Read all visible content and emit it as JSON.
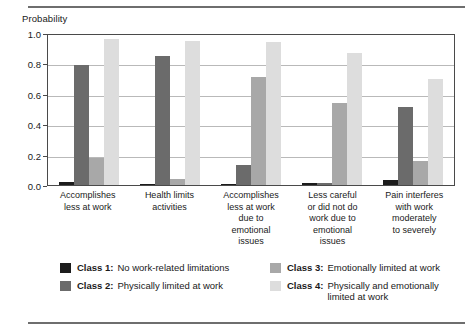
{
  "figure": {
    "y_axis_title": "Probability"
  },
  "chart_data": {
    "type": "bar",
    "title": "",
    "xlabel": "",
    "ylabel": "Probability",
    "ylim": [
      0.0,
      1.0
    ],
    "yticks": [
      "0.0",
      "0.2",
      "0.4",
      "0.6",
      "0.8",
      "1.0"
    ],
    "ytick_values": [
      0.0,
      0.2,
      0.4,
      0.6,
      0.8,
      1.0
    ],
    "grid": true,
    "legend_position": "bottom",
    "categories": [
      "Accomplishes less at work",
      "Health limits activities",
      "Accomplishes less at work due to emotional issues",
      "Less careful or did not do work due to emotional issues",
      "Pain interferes with work moderately to severely"
    ],
    "category_lines": [
      [
        "Accomplishes",
        "less at work"
      ],
      [
        "Health limits",
        "activities"
      ],
      [
        "Accomplishes",
        "less at work",
        "due to",
        "emotional",
        "issues"
      ],
      [
        "Less careful",
        "or did not do",
        "work due to",
        "emotional",
        "issues"
      ],
      [
        "Pain interferes",
        "with work",
        "moderately",
        "to severely"
      ]
    ],
    "series": [
      {
        "name": "Class 1",
        "label": "Class 1:",
        "description": "No work-related limitations",
        "color": "#1c1c1c",
        "values": [
          0.02,
          0.005,
          0.005,
          0.01,
          0.03
        ]
      },
      {
        "name": "Class 2",
        "label": "Class 2:",
        "description": "Physically limited at work",
        "color": "#6b6b6b",
        "values": [
          0.79,
          0.85,
          0.13,
          0.01,
          0.51
        ]
      },
      {
        "name": "Class 3",
        "label": "Class 3:",
        "description": "Emotionally limited at work",
        "color": "#a8a8a8",
        "values": [
          0.18,
          0.04,
          0.71,
          0.54,
          0.16
        ]
      },
      {
        "name": "Class 4",
        "label": "Class 4:",
        "description": "Physically and emotionally limited at work",
        "color": "#dddddd",
        "values": [
          0.96,
          0.95,
          0.94,
          0.87,
          0.7
        ]
      }
    ]
  },
  "legend": {
    "columns": [
      [
        {
          "label": "Class 1:",
          "description": "No work-related limitations",
          "color": "#1c1c1c"
        },
        {
          "label": "Class 2:",
          "description": "Physically limited at work",
          "color": "#6b6b6b"
        }
      ],
      [
        {
          "label": "Class 3:",
          "description": "Emotionally limited at work",
          "color": "#a8a8a8"
        },
        {
          "label": "Class 4:",
          "description": "Physically and emotionally limited at work",
          "color": "#dddddd"
        }
      ]
    ]
  }
}
